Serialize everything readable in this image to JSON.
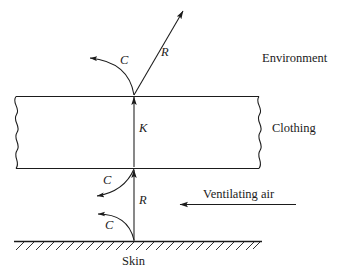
{
  "figure": {
    "background_color": "#ffffff",
    "line_color": "#1b1b1b",
    "text_color": "#1b1b1b",
    "width": 344,
    "height": 274
  },
  "regions": {
    "environment_label": "Environment",
    "clothing_label": "Clothing",
    "skin_label": "Skin",
    "ventilating_air_label": "Ventilating air"
  },
  "heat_paths": [
    {
      "id": "convection-environment",
      "symbol": "C",
      "mode": "convection",
      "origin": "clothing-outer-surface",
      "direction": "up-left",
      "style": "curved-arrow"
    },
    {
      "id": "radiation-environment",
      "symbol": "R",
      "mode": "radiation",
      "origin": "clothing-outer-surface",
      "direction": "up-right",
      "style": "straight-arrow"
    },
    {
      "id": "conduction-clothing",
      "symbol": "K",
      "mode": "conduction",
      "origin": "clothing-inner-surface",
      "direction": "up",
      "style": "straight-arrow"
    },
    {
      "id": "convection-clothing-inner",
      "symbol": "C",
      "mode": "convection",
      "origin": "clothing-inner-surface",
      "direction": "down-left",
      "style": "curved-arrow"
    },
    {
      "id": "radiation-skin",
      "symbol": "R",
      "mode": "radiation",
      "origin": "skin-surface",
      "direction": "up",
      "style": "straight-arrow"
    },
    {
      "id": "convection-skin",
      "symbol": "C",
      "mode": "convection",
      "origin": "skin-surface",
      "direction": "up-left",
      "style": "curved-arrow"
    }
  ],
  "labels": {
    "c_upper": "C",
    "r_upper": "R",
    "k_middle": "K",
    "c_middle": "C",
    "r_lower": "R",
    "c_lower": "C"
  }
}
